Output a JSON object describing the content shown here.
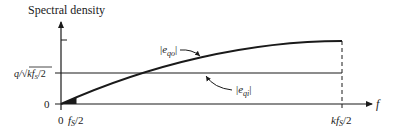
{
  "title": "Spectral density",
  "y_axis": {
    "label": "Spectral density",
    "ticks": [
      {
        "label": "0",
        "value": 0
      },
      {
        "label": "q/√(kfS/2)",
        "label_parts": {
          "q": "q/",
          "sqrt": "√",
          "k": "kf",
          "sub": "S",
          "tail": "/2"
        },
        "value": "q/sqrt(kfS/2)"
      }
    ]
  },
  "x_axis": {
    "label": "f",
    "ticks": [
      {
        "label": "0",
        "value": 0
      },
      {
        "label": "fS/2",
        "main": "f",
        "sub": "S",
        "tail": "/2"
      },
      {
        "label": "kfS/2",
        "main": "kf",
        "sub": "S",
        "tail": "/2"
      }
    ]
  },
  "curves": [
    {
      "name": "|eqo|",
      "main": "e",
      "sub": "qo",
      "description": "Oversampled quantization noise spectral density rising from 0 to kfS/2"
    },
    {
      "name": "|eqi|",
      "main": "e",
      "sub": "qi",
      "description": "Flat quantization noise spectral density level q/√(kfS/2)"
    }
  ],
  "colors": {
    "line": "#1a1a1a",
    "background": "#ffffff"
  }
}
